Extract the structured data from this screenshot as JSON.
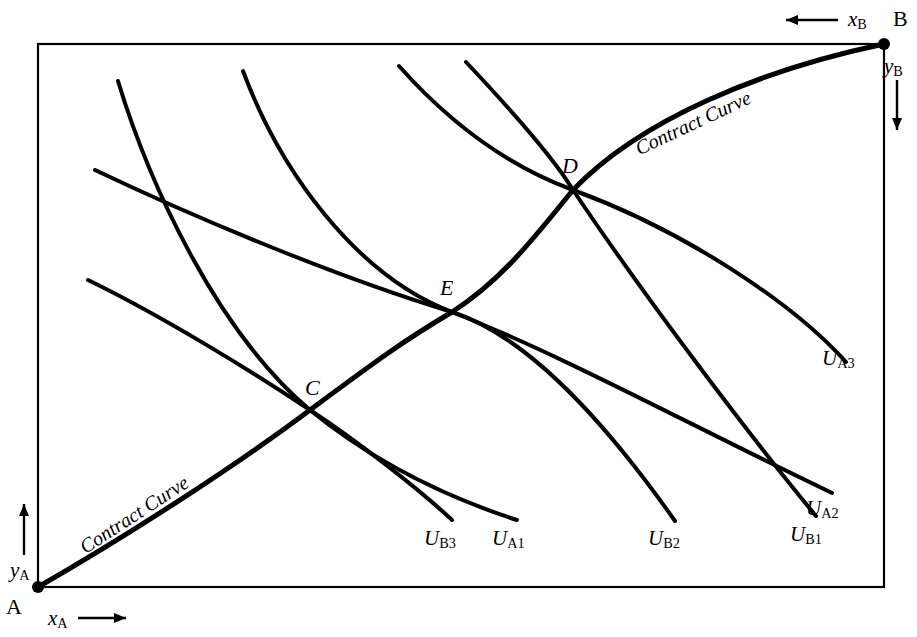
{
  "figure": {
    "type": "edgeworth-box-diagram",
    "background": "#ffffff",
    "ink": "#000000",
    "box": {
      "left": 38,
      "top": 44,
      "right": 884,
      "bottom": 587
    }
  },
  "corners": {
    "origin_a": {
      "label": "A",
      "x": 38,
      "y": 587
    },
    "origin_b": {
      "label": "B",
      "x": 884,
      "y": 44
    }
  },
  "axes": [
    {
      "name": "x-a-axis",
      "label": "x",
      "sub": "A",
      "arrow": "right"
    },
    {
      "name": "y-a-axis",
      "label": "y",
      "sub": "A",
      "arrow": "up"
    },
    {
      "name": "x-b-axis",
      "label": "x",
      "sub": "B",
      "arrow": "left"
    },
    {
      "name": "y-b-axis",
      "label": "y",
      "sub": "B",
      "arrow": "down"
    }
  ],
  "contract_curve": {
    "label": "Contract Curve",
    "occurrences": 2,
    "tangency_points": [
      "C",
      "E",
      "D"
    ]
  },
  "tangency_points": [
    {
      "label": "C",
      "x": 310,
      "y": 410
    },
    {
      "label": "E",
      "x": 452,
      "y": 312
    },
    {
      "label": "D",
      "x": 573,
      "y": 190
    }
  ],
  "indifference_curves": [
    {
      "label": "U",
      "sub": "A1",
      "owner": "A",
      "level": 1,
      "end_x": 517,
      "end_y": 520
    },
    {
      "label": "U",
      "sub": "A2",
      "owner": "A",
      "level": 2,
      "end_x": 832,
      "end_y": 493
    },
    {
      "label": "U",
      "sub": "A3",
      "owner": "A",
      "level": 3,
      "end_x": 846,
      "end_y": 362
    },
    {
      "label": "U",
      "sub": "B1",
      "owner": "B",
      "level": 1,
      "end_x": 816,
      "end_y": 516
    },
    {
      "label": "U",
      "sub": "B2",
      "owner": "B",
      "level": 2,
      "end_x": 675,
      "end_y": 521
    },
    {
      "label": "U",
      "sub": "B3",
      "owner": "B",
      "level": 3,
      "end_x": 452,
      "end_y": 520
    }
  ],
  "chart_data": {
    "type": "line",
    "title": "",
    "xlabel": "",
    "ylabel": "",
    "grid": false,
    "legend": "none",
    "series": [
      {
        "name": "Contract Curve",
        "path": "M 38 587 C 120 540, 230 470, 310 410 C 380 358, 405 340, 452 312 C 505 278, 540 230, 573 190 C 640 120, 760 70, 884 44"
      },
      {
        "name": "U_A1",
        "path": "M 118 81 C 148 180, 215 330, 310 410 C 380 467, 455 500, 517 520"
      },
      {
        "name": "U_A2",
        "path": "M 243 71 C 280 170, 355 275, 452 312 C 560 354, 700 430, 832 493"
      },
      {
        "name": "U_A3",
        "path": "M 399 66 C 447 120, 505 165, 573 190 C 680 229, 790 300, 846 362"
      },
      {
        "name": "U_B1",
        "path": "M 466 62 C 530 130, 558 165, 573 190 C 640 290, 745 430, 816 516"
      },
      {
        "name": "U_B2",
        "path": "M 95 170 C 200 220, 340 278, 452 312 C 540 340, 625 450, 675 521"
      },
      {
        "name": "U_B3",
        "path": "M 88 280 C 160 315, 250 370, 310 410 C 360 443, 420 490, 452 520"
      }
    ]
  }
}
